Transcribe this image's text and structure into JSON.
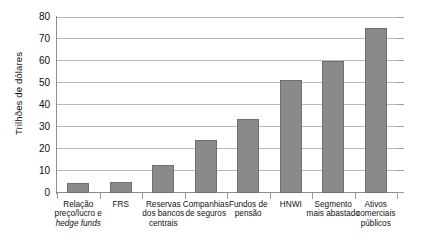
{
  "chart_data": {
    "type": "bar",
    "title": "",
    "xlabel": "",
    "ylabel": "Trilhões de dólares",
    "ylim": [
      0,
      80
    ],
    "ytick_labels": [
      "0",
      "10",
      "20",
      "30",
      "40",
      "50",
      "60",
      "70",
      "80"
    ],
    "yticks": [
      0,
      10,
      20,
      30,
      40,
      50,
      60,
      70,
      80
    ],
    "grid": true,
    "legend": false,
    "bar_color": "#8a8a8a",
    "bar_border_color": "#6f6f6f",
    "categories": [
      "Relação preço/lucro e hedge funds",
      "FRS",
      "Reservas dos bancos centrais",
      "Companhias de seguros",
      "Fundos de pensão",
      "HNWI",
      "Segmento mais abastado",
      "Ativos comerciais públicos"
    ],
    "values": [
      4.5,
      5,
      12.5,
      24,
      33.5,
      51.5,
      60,
      75
    ]
  },
  "axis": {
    "y_title": "Trilhões de dólares"
  },
  "categories_display": [
    {
      "line1": "Relação",
      "line2": "preço/lucro e",
      "line3": "hedge funds",
      "line3_italic": true
    },
    {
      "line1": "FRS",
      "line2": "",
      "line3": ""
    },
    {
      "line1": "Reservas",
      "line2": "dos bancos",
      "line3": "centrais"
    },
    {
      "line1": "Companhias",
      "line2": "de seguros",
      "line3": ""
    },
    {
      "line1": "Fundos de",
      "line2": "pensão",
      "line3": ""
    },
    {
      "line1": "HNWI",
      "line2": "",
      "line3": ""
    },
    {
      "line1": "Segmento",
      "line2": "mais abastado",
      "line3": ""
    },
    {
      "line1": "Ativos",
      "line2": "comerciais",
      "line3": "públicos"
    }
  ]
}
